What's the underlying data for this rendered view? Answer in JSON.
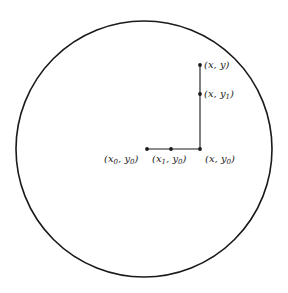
{
  "diagram": {
    "colors": {
      "stroke": "#1a1a1a",
      "background": "#ffffff",
      "text": "#222222"
    },
    "circle": {
      "cx": 144,
      "cy": 149,
      "r": 128
    },
    "path": [
      {
        "x": 147,
        "y": 149
      },
      {
        "x": 200,
        "y": 149
      },
      {
        "x": 200,
        "y": 65
      }
    ],
    "points": [
      {
        "id": "x0-y0",
        "x": 147,
        "y": 149,
        "label": {
          "open": "(",
          "a": "x",
          "a_sub": "0",
          "sep": ", ",
          "b": "y",
          "b_sub": "0",
          "close": ")"
        }
      },
      {
        "id": "x1-y0",
        "x": 171,
        "y": 149,
        "label": {
          "open": "(",
          "a": "x",
          "a_sub": "1",
          "sep": ", ",
          "b": "y",
          "b_sub": "0",
          "close": ")"
        }
      },
      {
        "id": "x-y0",
        "x": 200,
        "y": 149,
        "label": {
          "open": "(",
          "a": "x",
          "a_sub": "",
          "sep": ", ",
          "b": "y",
          "b_sub": "0",
          "close": ")"
        }
      },
      {
        "id": "x-y1",
        "x": 200,
        "y": 94,
        "label": {
          "open": "(",
          "a": "x",
          "a_sub": "",
          "sep": ", ",
          "b": "y",
          "b_sub": "1",
          "close": ")"
        }
      },
      {
        "id": "x-y",
        "x": 200,
        "y": 65,
        "label": {
          "open": "(",
          "a": "x",
          "a_sub": "",
          "sep": ", ",
          "b": "y",
          "b_sub": "",
          "close": ")"
        }
      }
    ]
  }
}
